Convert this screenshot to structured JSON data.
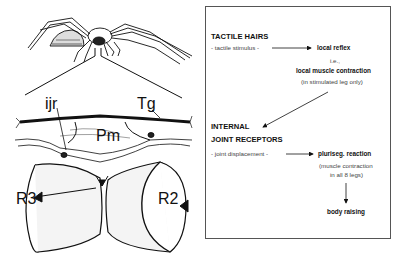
{
  "figure": {
    "drawing": {
      "labels": {
        "ijr": "ijr",
        "tg": "Tg",
        "pm": "Pm",
        "r3": "R3",
        "r2": "R2"
      }
    },
    "flowchart": {
      "tactile": {
        "heading": "TACTILE HAIRS",
        "stimulus": "- tactile stimulus -",
        "result": "local reflex",
        "ie": "i.e.,",
        "detail": "local muscle contraction",
        "note": "(in stimulated leg only)"
      },
      "internal": {
        "heading_line1": "INTERNAL",
        "heading_line2": "JOINT RECEPTORS",
        "stimulus": "- joint displacement -",
        "result": "pluriseg. reaction",
        "note_line1": "(muscle contraction",
        "note_line2": "in all 8 legs)",
        "outcome": "body raising"
      }
    }
  }
}
